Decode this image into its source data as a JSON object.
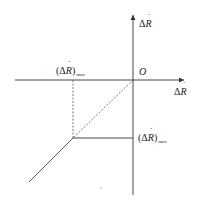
{
  "diagram": {
    "axes": {
      "vertical": {
        "label_prefix": "Δ",
        "label_var": "R",
        "label_dot": true
      },
      "horizontal": {
        "label_prefix": "Δ",
        "label_var": "R",
        "label_dot": true
      },
      "origin_label": "O"
    },
    "annotations": {
      "top_left_limit": {
        "open": "(Δ",
        "var": "R",
        "close": ")",
        "subscript": "max"
      },
      "right_limit": {
        "open": "(Δ",
        "var": "R",
        "close": ")",
        "subscript": "max"
      }
    },
    "colors": {
      "line": "#333333",
      "dashed": "#555555",
      "text": "#222222"
    }
  }
}
